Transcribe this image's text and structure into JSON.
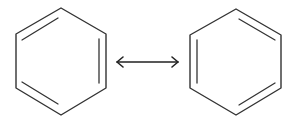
{
  "diagram": {
    "title": "",
    "type": "resonance-structures",
    "colors": {
      "stroke": "#333333",
      "background": "#ffffff"
    },
    "structures": [
      {
        "name": "kekule-structure-1",
        "hexagon": [
          [
            61,
            8
          ],
          [
            106,
            34
          ],
          [
            106,
            88
          ],
          [
            61,
            115
          ],
          [
            16,
            88
          ],
          [
            16,
            34
          ]
        ],
        "double_bonds": [
          [
            [
              22,
              40
            ],
            [
              58,
              18
            ]
          ],
          [
            [
              99,
              39
            ],
            [
              99,
              83
            ]
          ],
          [
            [
              22,
              82
            ],
            [
              58,
              104
            ]
          ]
        ]
      },
      {
        "name": "kekule-structure-2",
        "hexagon": [
          [
            236,
            9
          ],
          [
            281,
            35
          ],
          [
            281,
            88
          ],
          [
            236,
            115
          ],
          [
            190,
            88
          ],
          [
            190,
            35
          ]
        ],
        "double_bonds": [
          [
            [
              239,
              19
            ],
            [
              275,
              40
            ]
          ],
          [
            [
              197,
              40
            ],
            [
              197,
              83
            ]
          ],
          [
            [
              239,
              105
            ],
            [
              275,
              83
            ]
          ]
        ]
      }
    ],
    "arrow": {
      "type": "resonance-double-headed",
      "x1": 117,
      "x2": 178,
      "y": 62
    }
  }
}
